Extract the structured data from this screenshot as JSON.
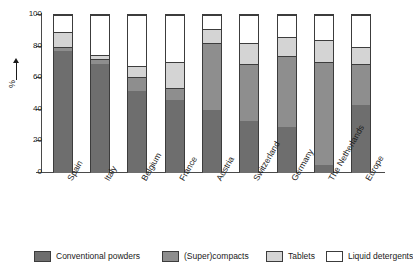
{
  "chart_data": {
    "type": "bar",
    "subtype": "stacked-bar-100-percent",
    "title": "",
    "xlabel": "",
    "ylabel": "%",
    "ylim": [
      0,
      100
    ],
    "yticks": [
      0,
      20,
      40,
      60,
      80,
      100
    ],
    "ytick_labels": [
      "0",
      "20",
      "40",
      "60",
      "80",
      "100"
    ],
    "grid": false,
    "legend_position": "bottom",
    "categories": [
      "Spain",
      "Italy",
      "Belgium",
      "France",
      "Austria",
      "Switzerland",
      "Germany",
      "The Netherlands",
      "Europe"
    ],
    "series": [
      {
        "name": "Conventional powders",
        "color": "#6e6e6e",
        "values": [
          77,
          69,
          52,
          46,
          40,
          33,
          29,
          5,
          43
        ]
      },
      {
        "name": "(Super)compacts",
        "color": "#8e8e8e",
        "values": [
          3,
          3,
          9,
          8,
          42,
          36,
          45,
          65,
          26
        ]
      },
      {
        "name": "Tablets",
        "color": "#d4d4d4",
        "values": [
          9,
          3,
          7,
          16,
          9,
          13,
          12,
          14,
          11
        ]
      },
      {
        "name": "Liquid detergents",
        "color": "#ffffff",
        "values": [
          11,
          25,
          32,
          30,
          9,
          18,
          14,
          16,
          20
        ]
      }
    ],
    "segment_tops": {
      "Spain": [
        77,
        80,
        89,
        100
      ],
      "Italy": [
        69,
        72,
        75,
        100
      ],
      "Belgium": [
        52,
        61,
        68,
        100
      ],
      "France": [
        46,
        54,
        70,
        100
      ],
      "Austria": [
        40,
        82,
        91,
        100
      ],
      "Switzerland": [
        33,
        69,
        82,
        100
      ],
      "Germany": [
        29,
        74,
        86,
        100
      ],
      "The Netherlands": [
        5,
        70,
        84,
        100
      ],
      "Europe": [
        43,
        69,
        80,
        100
      ]
    }
  },
  "legend": {
    "items": [
      {
        "label": "Conventional powders",
        "color": "#6e6e6e"
      },
      {
        "label": "(Super)compacts",
        "color": "#8e8e8e"
      },
      {
        "label": "Tablets",
        "color": "#d4d4d4"
      },
      {
        "label": "Liquid detergents",
        "color": "#ffffff"
      }
    ]
  },
  "axis": {
    "y_title": "%"
  }
}
